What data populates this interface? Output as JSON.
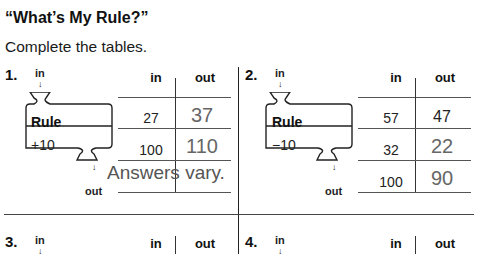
{
  "header": {
    "title": "“What’s My Rule?”",
    "instructions": "Complete the tables."
  },
  "problems": [
    {
      "number": "1.",
      "in_label": "in",
      "out_label": "out",
      "rule_label": "Rule",
      "rule_value": "+10",
      "table": {
        "headers": [
          "in",
          "out"
        ],
        "rows": [
          {
            "in": "27",
            "out": "37"
          },
          {
            "in": "100",
            "out": "110"
          },
          {
            "in": "",
            "out": ""
          }
        ]
      },
      "note": "Answers vary."
    },
    {
      "number": "2.",
      "in_label": "in",
      "out_label": "out",
      "rule_label": "Rule",
      "rule_value": "−10",
      "table": {
        "headers": [
          "in",
          "out"
        ],
        "rows": [
          {
            "in": "57",
            "out": "47"
          },
          {
            "in": "32",
            "out": "22"
          },
          {
            "in": "100",
            "out": "90"
          }
        ]
      }
    },
    {
      "number": "3.",
      "in_label": "in",
      "table": {
        "headers": [
          "in",
          "out"
        ]
      }
    },
    {
      "number": "4.",
      "in_label": "in",
      "table": {
        "headers": [
          "in",
          "out"
        ]
      }
    }
  ],
  "icons": {
    "down_arrow": "↓"
  }
}
